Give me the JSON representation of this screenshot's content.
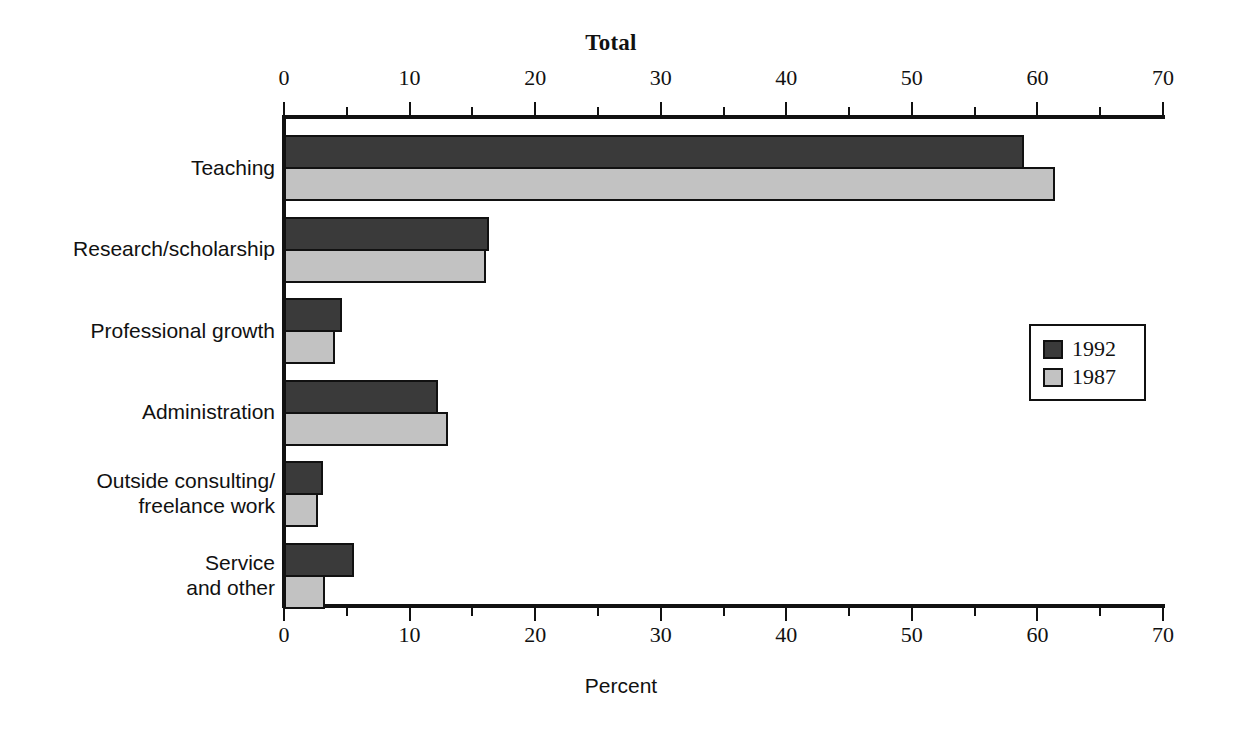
{
  "chart_data": {
    "type": "bar",
    "orientation": "horizontal",
    "title": "Total",
    "xlabel": "Percent",
    "ylabel": "",
    "xlim": [
      0,
      70
    ],
    "xticks": [
      0,
      10,
      20,
      30,
      40,
      50,
      60,
      70
    ],
    "xtick_labels": [
      "0",
      "10",
      "20",
      "30",
      "40",
      "50",
      "60",
      "70"
    ],
    "minor_tick_step": 5,
    "grid": false,
    "legend_position": "right-middle",
    "categories": [
      "Teaching",
      "Research/scholarship",
      "Professional growth",
      "Administration",
      "Outside consulting/\nfreelance work",
      "Service\nand other"
    ],
    "series": [
      {
        "name": "1992",
        "color": "#3a3a3a",
        "values": [
          58.9,
          16.3,
          4.6,
          12.3,
          3.1,
          5.6
        ]
      },
      {
        "name": "1987",
        "color": "#c2c2c2",
        "values": [
          61.4,
          16.1,
          4.1,
          13.1,
          2.7,
          3.3
        ]
      }
    ],
    "axis_captions": {
      "top": "Total",
      "bottom": "Percent"
    }
  },
  "legend": {
    "entries": [
      {
        "label": "1992",
        "color": "#3a3a3a"
      },
      {
        "label": "1987",
        "color": "#c2c2c2"
      }
    ]
  },
  "colors": {
    "series_1992": "#3a3a3a",
    "series_1987": "#c2c2c2",
    "axis": "#111111",
    "background": "#ffffff"
  }
}
